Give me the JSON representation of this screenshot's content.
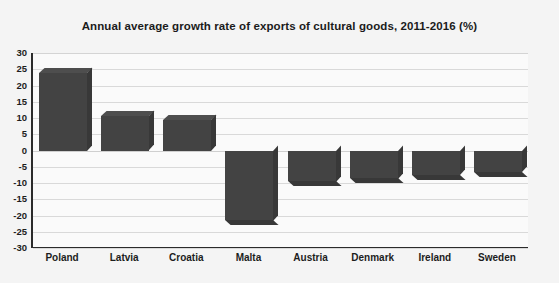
{
  "chart_data": {
    "type": "bar",
    "title": "Annual average growth rate of exports of cultural goods, 2011-2016 (%)",
    "xlabel": "",
    "ylabel": "",
    "categories": [
      "Poland",
      "Latvia",
      "Croatia",
      "Malta",
      "Austria",
      "Denmark",
      "Ireland",
      "Sweden"
    ],
    "values": [
      24.0,
      10.5,
      9.5,
      -21.5,
      -9.5,
      -8.5,
      -7.5,
      -6.5
    ],
    "ylim": [
      -30,
      30
    ],
    "yticks": [
      30,
      25,
      20,
      15,
      10,
      5,
      0,
      -5,
      -10,
      -15,
      -20,
      -25,
      -30
    ],
    "ytick_labels": [
      "30",
      "25",
      "20",
      "15",
      "10",
      "5",
      "0",
      "-5",
      "-10",
      "-15",
      "-20",
      "-25",
      "-30"
    ],
    "grid": true,
    "legend": false,
    "series": [
      {
        "name": "Annual average growth rate",
        "values": [
          24.0,
          10.5,
          9.5,
          -21.5,
          -9.5,
          -8.5,
          -7.5,
          -6.5
        ]
      }
    ],
    "colors": {
      "bar": "#434343",
      "bar_top": "#4e4e4e",
      "bar_side": "#383838",
      "plot_background": "#fafafa",
      "page_background": "#f4f4f4",
      "gridline": "#d9d9d9",
      "axis": "#2b2b2b",
      "text": "#1d1d1d"
    }
  }
}
